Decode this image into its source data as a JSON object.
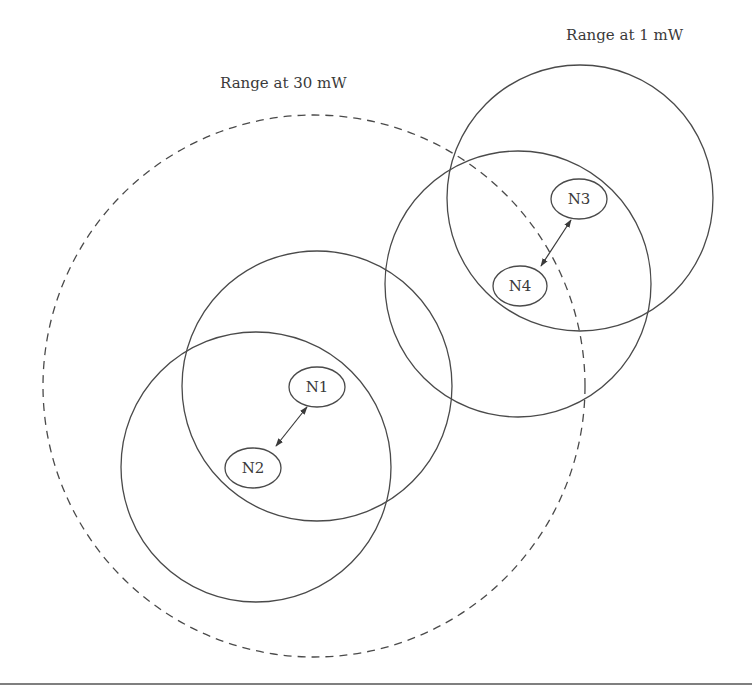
{
  "diagram": {
    "labels": {
      "range_30mw": "Range at 30 mW",
      "range_1mw": "Range at 1 mW"
    },
    "colors": {
      "stroke": "#4a4a4a",
      "text": "#3a3a3a",
      "background": "#ffffff"
    },
    "large_range_circle": {
      "power": "30 mW",
      "style": "dashed",
      "cx": 314,
      "cy": 386,
      "r": 271
    },
    "nodes": [
      {
        "id": "N1",
        "label": "N1",
        "cx": 317,
        "cy": 387,
        "range_circle": {
          "power": "1 mW",
          "cx": 317,
          "cy": 386,
          "r": 135
        }
      },
      {
        "id": "N2",
        "label": "N2",
        "cx": 253,
        "cy": 468,
        "range_circle": {
          "power": "1 mW",
          "cx": 256,
          "cy": 467,
          "r": 135
        }
      },
      {
        "id": "N3",
        "label": "N3",
        "cx": 579,
        "cy": 199,
        "range_circle": {
          "power": "1 mW",
          "cx": 580,
          "cy": 198,
          "r": 133
        }
      },
      {
        "id": "N4",
        "label": "N4",
        "cx": 520,
        "cy": 286,
        "range_circle": {
          "power": "1 mW",
          "cx": 518,
          "cy": 284,
          "r": 133
        }
      }
    ],
    "links": [
      {
        "from": "N1",
        "to": "N2",
        "type": "bidirectional"
      },
      {
        "from": "N3",
        "to": "N4",
        "type": "bidirectional"
      }
    ]
  }
}
